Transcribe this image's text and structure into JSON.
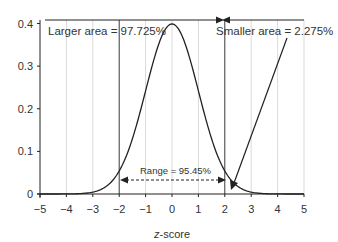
{
  "chart_data": {
    "type": "line",
    "title": "",
    "xlabel": "z-score",
    "ylabel": "",
    "xlim": [
      -5,
      5
    ],
    "ylim": [
      0,
      0.4
    ],
    "x_ticks": [
      "−5",
      "−4",
      "−3",
      "−2",
      "−1",
      "0",
      "1",
      "2",
      "3",
      "4",
      "5"
    ],
    "y_ticks": [
      "0",
      "0.1",
      "0.2",
      "0.3",
      "0.4"
    ],
    "grid": "vertical",
    "series": [
      {
        "name": "Standard normal density",
        "function": "N(0,1) pdf",
        "peak": [
          0,
          0.399
        ]
      }
    ],
    "annotations": {
      "larger_area": "Larger area = 97.725%",
      "smaller_area": "Smaller area = 2.275%",
      "range": "Range = 95.45%"
    },
    "markers": {
      "range_from": -2,
      "range_to": 2,
      "cutoff": 2
    }
  }
}
